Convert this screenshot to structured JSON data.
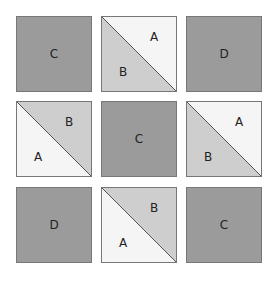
{
  "colors": {
    "solid": "#9b9b9b",
    "shade_b": "#cecece",
    "shade_a": "#f5f5f5",
    "border": "#777777",
    "text": "#222222"
  },
  "tiles": [
    {
      "row": 0,
      "col": 0,
      "type": "solid",
      "label": "C"
    },
    {
      "row": 0,
      "col": 1,
      "type": "split",
      "upper_right": "A",
      "lower_left": "B",
      "upper_shade": "a",
      "lower_shade": "b"
    },
    {
      "row": 0,
      "col": 2,
      "type": "solid",
      "label": "D"
    },
    {
      "row": 1,
      "col": 0,
      "type": "split",
      "upper_right": "B",
      "lower_left": "A",
      "upper_shade": "b",
      "lower_shade": "a"
    },
    {
      "row": 1,
      "col": 1,
      "type": "solid",
      "label": "C"
    },
    {
      "row": 1,
      "col": 2,
      "type": "split",
      "upper_right": "A",
      "lower_left": "B",
      "upper_shade": "a",
      "lower_shade": "b"
    },
    {
      "row": 2,
      "col": 0,
      "type": "solid",
      "label": "D"
    },
    {
      "row": 2,
      "col": 1,
      "type": "split",
      "upper_right": "B",
      "lower_left": "A",
      "upper_shade": "b",
      "lower_shade": "a"
    },
    {
      "row": 2,
      "col": 2,
      "type": "solid",
      "label": "C"
    }
  ]
}
